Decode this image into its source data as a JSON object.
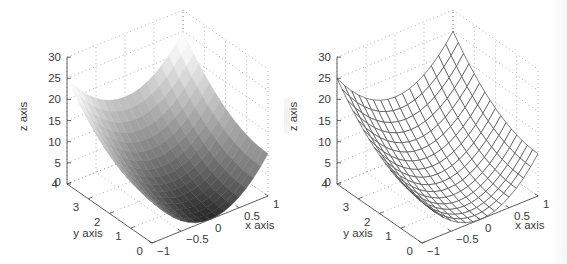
{
  "figure": {
    "panels": [
      {
        "id": "left",
        "style": "shaded-surface",
        "xlabel": "x axis",
        "ylabel": "y axis",
        "zlabel": "z axis",
        "xticks": [
          "−1",
          "−0.5",
          "0",
          "0.5",
          "1"
        ],
        "yticks": [
          "0",
          "1",
          "2",
          "3",
          "4"
        ],
        "zticks": [
          "0",
          "5",
          "10",
          "15",
          "20",
          "25",
          "30"
        ]
      },
      {
        "id": "right",
        "style": "wireframe-mesh",
        "xlabel": "x axis",
        "ylabel": "y axis",
        "zlabel": "z axis",
        "xticks": [
          "−1",
          "−0.5",
          "0",
          "0.5",
          "1"
        ],
        "yticks": [
          "0",
          "1",
          "2",
          "3",
          "4"
        ],
        "zticks": [
          "0",
          "5",
          "10",
          "15",
          "20",
          "25",
          "30"
        ]
      }
    ]
  },
  "chart_data": [
    {
      "type": "surface",
      "title": "",
      "render": "shaded (grayscale, dark at low z, light at high z)",
      "xlabel": "x axis",
      "ylabel": "y axis",
      "zlabel": "z axis",
      "xlim": [
        -1,
        1
      ],
      "ylim": [
        0,
        4
      ],
      "zlim": [
        0,
        30
      ],
      "xticks": [
        -1,
        -0.5,
        0,
        0.5,
        1
      ],
      "yticks": [
        0,
        1,
        2,
        3,
        4
      ],
      "zticks": [
        0,
        5,
        10,
        15,
        20,
        25,
        30
      ],
      "grid": true,
      "grid_size": [
        17,
        17
      ],
      "surface_approx": "parabolic trough: z ≈ 10·x² + (15/16)·y², min ≈ 0 at (0,0), ≈ 25 at (±1,4)",
      "corner_values": {
        "x=-1,y=0": 10,
        "x=1,y=0": 10,
        "x=-1,y=4": 25,
        "x=1,y=4": 25,
        "x=0,y=0": 0,
        "x=0,y=4": 15
      }
    },
    {
      "type": "surface",
      "title": "",
      "render": "wireframe mesh",
      "xlabel": "x axis",
      "ylabel": "y axis",
      "zlabel": "z axis",
      "xlim": [
        -1,
        1
      ],
      "ylim": [
        0,
        4
      ],
      "zlim": [
        0,
        30
      ],
      "xticks": [
        -1,
        -0.5,
        0,
        0.5,
        1
      ],
      "yticks": [
        0,
        1,
        2,
        3,
        4
      ],
      "zticks": [
        0,
        5,
        10,
        15,
        20,
        25,
        30
      ],
      "grid": true,
      "grid_size": [
        17,
        17
      ],
      "surface_approx": "parabolic trough: z ≈ 10·x² + (15/16)·y², min ≈ 0 at (0,0), ≈ 25 at (±1,4)",
      "corner_values": {
        "x=-1,y=0": 10,
        "x=1,y=0": 10,
        "x=-1,y=4": 25,
        "x=1,y=4": 25,
        "x=0,y=0": 0,
        "x=0,y=4": 15
      }
    }
  ]
}
